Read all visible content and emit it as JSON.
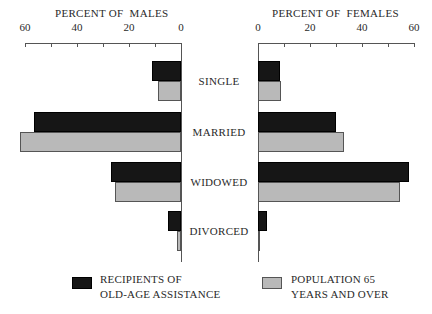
{
  "chart_data": {
    "type": "bar",
    "orientation": "horizontal",
    "layout": "back-to-back (population pyramid style)",
    "categories": [
      "SINGLE",
      "MARRIED",
      "WIDOWED",
      "DIVORCED"
    ],
    "panels": [
      {
        "title": "PERCENT OF  MALES",
        "direction": "leftward",
        "xlim": [
          0,
          60
        ],
        "ticks": [
          0,
          10,
          20,
          30,
          40,
          50,
          60
        ],
        "tick_labels": [
          "0",
          "20",
          "40",
          "60"
        ],
        "series": [
          {
            "name": "RECIPIENTS OF OLD-AGE ASSISTANCE",
            "color": "#161616",
            "values": [
              11,
              56.5,
              27,
              5
            ]
          },
          {
            "name": "POPULATION 65 YEARS AND OVER",
            "color": "#b9b9b9",
            "values": [
              9,
              62,
              25.5,
              1.5
            ]
          }
        ]
      },
      {
        "title": "PERCENT OF  FEMALES",
        "direction": "rightward",
        "xlim": [
          0,
          60
        ],
        "ticks": [
          0,
          10,
          20,
          30,
          40,
          50,
          60
        ],
        "tick_labels": [
          "0",
          "20",
          "40",
          "60"
        ],
        "series": [
          {
            "name": "RECIPIENTS OF OLD-AGE ASSISTANCE",
            "color": "#161616",
            "values": [
              8.5,
              30,
              58,
              3.5
            ]
          },
          {
            "name": "POPULATION 65 YEARS AND OVER",
            "color": "#b9b9b9",
            "values": [
              9,
              33,
              54.5,
              0.5
            ]
          }
        ]
      }
    ],
    "legend": {
      "position": "bottom",
      "entries": [
        {
          "lines": [
            "RECIPIENTS OF",
            "OLD-AGE ASSISTANCE"
          ],
          "color": "#161616"
        },
        {
          "lines": [
            "POPULATION 65",
            "YEARS AND OVER"
          ],
          "color": "#b9b9b9"
        }
      ]
    },
    "grid": false
  }
}
